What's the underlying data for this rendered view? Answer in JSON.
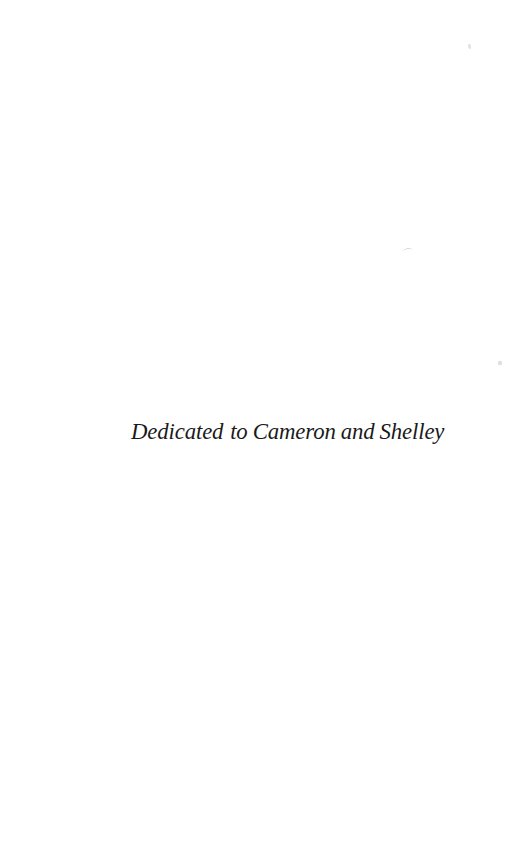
{
  "page": {
    "type": "book-dedication-page",
    "background_color": "#ffffff",
    "width": 513,
    "height": 859
  },
  "dedication": {
    "full_text": "Dedicated to Cameron and Shelley",
    "lead_word": "Dedicated",
    "rest_text": "to Cameron and Shelley",
    "ink_color": "#1a1a1a",
    "style": "italic-serif"
  },
  "artifacts": {
    "speck_top_right": "scan-speck",
    "speck_middle_right": "scan-speck",
    "speck_lower_right": "scan-speck"
  }
}
